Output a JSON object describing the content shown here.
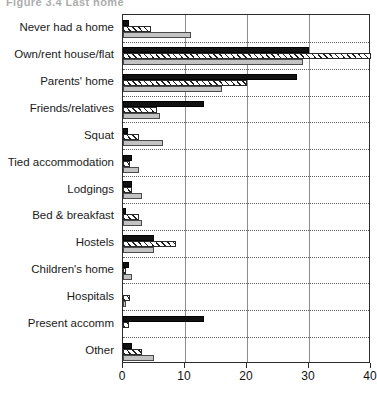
{
  "figure": {
    "title": "Figure 3.4  Last home"
  },
  "chart_data": {
    "type": "bar",
    "orientation": "horizontal",
    "title": "Figure 3.4  Last home",
    "xlabel": "",
    "ylabel": "",
    "xlim": [
      0,
      40
    ],
    "xticks": [
      0,
      10,
      20,
      30,
      40
    ],
    "grid": true,
    "legend": "none",
    "categories": [
      "Never had a home",
      "Own/rent house/flat",
      "Parents' home",
      "Friends/relatives",
      "Squat",
      "Tied accommodation",
      "Lodgings",
      "Bed & breakfast",
      "Hostels",
      "Children's home",
      "Hospitals",
      "Present accomm",
      "Other"
    ],
    "series": [
      {
        "name": "Series 1",
        "pattern": "solid-black",
        "color": "#111111",
        "values": [
          1.0,
          30.0,
          28.0,
          13.0,
          0.8,
          1.5,
          1.5,
          0.5,
          5.0,
          1.0,
          0.0,
          13.0,
          1.5
        ]
      },
      {
        "name": "Series 2",
        "pattern": "diagonal-hatch",
        "color": "#ffffff",
        "values": [
          4.5,
          40.0,
          20.0,
          5.5,
          2.5,
          1.2,
          1.5,
          2.5,
          8.5,
          0.5,
          1.2,
          1.0,
          3.0
        ]
      },
      {
        "name": "Series 3",
        "pattern": "solid-gray",
        "color": "#c3c3c3",
        "values": [
          11.0,
          29.0,
          16.0,
          6.0,
          6.5,
          2.5,
          3.0,
          3.0,
          5.0,
          1.5,
          0.5,
          0.0,
          5.0
        ]
      }
    ]
  }
}
